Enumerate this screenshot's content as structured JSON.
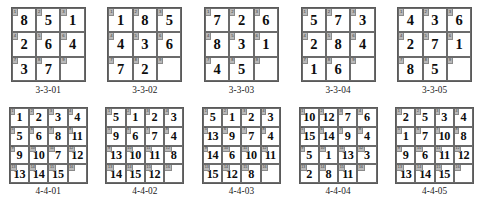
{
  "page": {
    "background_color": "#ffffff",
    "grid_border_color": "#5a5a5a",
    "cell_border_color": "#6b6b6b",
    "index_tag_color": "#b9b9b9",
    "value_color": "#0d0d0d"
  },
  "rows": [
    {
      "name": "three-by-three-row",
      "size": 3,
      "puzzles": [
        {
          "label": "3-3-01",
          "size": 3,
          "cells": [
            {
              "index": "1",
              "value": "8"
            },
            {
              "index": "2",
              "value": "5"
            },
            {
              "index": "3",
              "value": "1"
            },
            {
              "index": "4",
              "value": "2"
            },
            {
              "index": "5",
              "value": "6"
            },
            {
              "index": "6",
              "value": "4"
            },
            {
              "index": "7",
              "value": "3"
            },
            {
              "index": "8",
              "value": "7"
            },
            {
              "index": "9",
              "value": ""
            }
          ]
        },
        {
          "label": "3-3-02",
          "size": 3,
          "cells": [
            {
              "index": "1",
              "value": "1"
            },
            {
              "index": "2",
              "value": "8"
            },
            {
              "index": "3",
              "value": "5"
            },
            {
              "index": "4",
              "value": "4"
            },
            {
              "index": "5",
              "value": "3"
            },
            {
              "index": "6",
              "value": "6"
            },
            {
              "index": "7",
              "value": "7"
            },
            {
              "index": "8",
              "value": "2"
            },
            {
              "index": "9",
              "value": ""
            }
          ]
        },
        {
          "label": "3-3-03",
          "size": 3,
          "cells": [
            {
              "index": "1",
              "value": "7"
            },
            {
              "index": "2",
              "value": "2"
            },
            {
              "index": "3",
              "value": "6"
            },
            {
              "index": "4",
              "value": "8"
            },
            {
              "index": "5",
              "value": "3"
            },
            {
              "index": "6",
              "value": "1"
            },
            {
              "index": "7",
              "value": "4"
            },
            {
              "index": "8",
              "value": "5"
            },
            {
              "index": "9",
              "value": ""
            }
          ]
        },
        {
          "label": "3-3-04",
          "size": 3,
          "cells": [
            {
              "index": "1",
              "value": "5"
            },
            {
              "index": "2",
              "value": "7"
            },
            {
              "index": "3",
              "value": "3"
            },
            {
              "index": "4",
              "value": "2"
            },
            {
              "index": "5",
              "value": "8"
            },
            {
              "index": "6",
              "value": "4"
            },
            {
              "index": "7",
              "value": "1"
            },
            {
              "index": "8",
              "value": "6"
            },
            {
              "index": "9",
              "value": ""
            }
          ]
        },
        {
          "label": "3-3-05",
          "size": 3,
          "cells": [
            {
              "index": "1",
              "value": "4"
            },
            {
              "index": "2",
              "value": "3"
            },
            {
              "index": "3",
              "value": "6"
            },
            {
              "index": "4",
              "value": "2"
            },
            {
              "index": "5",
              "value": "7"
            },
            {
              "index": "6",
              "value": "1"
            },
            {
              "index": "7",
              "value": "8"
            },
            {
              "index": "8",
              "value": "5"
            },
            {
              "index": "9",
              "value": ""
            }
          ]
        }
      ]
    },
    {
      "name": "four-by-four-row",
      "size": 4,
      "puzzles": [
        {
          "label": "4-4-01",
          "size": 4,
          "cells": [
            {
              "index": "1",
              "value": "1"
            },
            {
              "index": "2",
              "value": "2"
            },
            {
              "index": "3",
              "value": "3"
            },
            {
              "index": "4",
              "value": "4"
            },
            {
              "index": "5",
              "value": "5"
            },
            {
              "index": "6",
              "value": "6"
            },
            {
              "index": "7",
              "value": "8"
            },
            {
              "index": "8",
              "value": "11"
            },
            {
              "index": "9",
              "value": "9"
            },
            {
              "index": "10",
              "value": "10"
            },
            {
              "index": "11",
              "value": "7"
            },
            {
              "index": "12",
              "value": "12"
            },
            {
              "index": "13",
              "value": "13"
            },
            {
              "index": "14",
              "value": "14"
            },
            {
              "index": "15",
              "value": "15"
            },
            {
              "index": "16",
              "value": ""
            }
          ]
        },
        {
          "label": "4-4-02",
          "size": 4,
          "cells": [
            {
              "index": "1",
              "value": "5"
            },
            {
              "index": "2",
              "value": "1"
            },
            {
              "index": "3",
              "value": "2"
            },
            {
              "index": "4",
              "value": "3"
            },
            {
              "index": "5",
              "value": "9"
            },
            {
              "index": "6",
              "value": "6"
            },
            {
              "index": "7",
              "value": "7"
            },
            {
              "index": "8",
              "value": "4"
            },
            {
              "index": "9",
              "value": "13"
            },
            {
              "index": "10",
              "value": "10"
            },
            {
              "index": "11",
              "value": "11"
            },
            {
              "index": "12",
              "value": "8"
            },
            {
              "index": "13",
              "value": "14"
            },
            {
              "index": "14",
              "value": "15"
            },
            {
              "index": "15",
              "value": "12"
            },
            {
              "index": "16",
              "value": ""
            }
          ]
        },
        {
          "label": "4-4-03",
          "size": 4,
          "cells": [
            {
              "index": "1",
              "value": "5"
            },
            {
              "index": "2",
              "value": "1"
            },
            {
              "index": "3",
              "value": "2"
            },
            {
              "index": "4",
              "value": "3"
            },
            {
              "index": "5",
              "value": "13"
            },
            {
              "index": "6",
              "value": "9"
            },
            {
              "index": "7",
              "value": "7"
            },
            {
              "index": "8",
              "value": "4"
            },
            {
              "index": "9",
              "value": "14"
            },
            {
              "index": "10",
              "value": "6"
            },
            {
              "index": "11",
              "value": "10"
            },
            {
              "index": "12",
              "value": "11"
            },
            {
              "index": "13",
              "value": "15"
            },
            {
              "index": "14",
              "value": "12"
            },
            {
              "index": "15",
              "value": "8"
            },
            {
              "index": "16",
              "value": ""
            }
          ]
        },
        {
          "label": "4-4-04",
          "size": 4,
          "cells": [
            {
              "index": "1",
              "value": "10"
            },
            {
              "index": "2",
              "value": "12"
            },
            {
              "index": "3",
              "value": "7"
            },
            {
              "index": "4",
              "value": "6"
            },
            {
              "index": "5",
              "value": "15"
            },
            {
              "index": "6",
              "value": "14"
            },
            {
              "index": "7",
              "value": "9"
            },
            {
              "index": "8",
              "value": "4"
            },
            {
              "index": "9",
              "value": "5"
            },
            {
              "index": "10",
              "value": "1"
            },
            {
              "index": "11",
              "value": "13"
            },
            {
              "index": "12",
              "value": "3"
            },
            {
              "index": "13",
              "value": "2"
            },
            {
              "index": "14",
              "value": "8"
            },
            {
              "index": "15",
              "value": "11"
            },
            {
              "index": "16",
              "value": ""
            }
          ]
        },
        {
          "label": "4-4-05",
          "size": 4,
          "cells": [
            {
              "index": "1",
              "value": "2"
            },
            {
              "index": "2",
              "value": "5"
            },
            {
              "index": "3",
              "value": "3"
            },
            {
              "index": "4",
              "value": "4"
            },
            {
              "index": "5",
              "value": "1"
            },
            {
              "index": "6",
              "value": "7"
            },
            {
              "index": "7",
              "value": "10"
            },
            {
              "index": "8",
              "value": "8"
            },
            {
              "index": "9",
              "value": "9"
            },
            {
              "index": "10",
              "value": "6"
            },
            {
              "index": "11",
              "value": "11"
            },
            {
              "index": "12",
              "value": "12"
            },
            {
              "index": "13",
              "value": "13"
            },
            {
              "index": "14",
              "value": "14"
            },
            {
              "index": "15",
              "value": "15"
            },
            {
              "index": "16",
              "value": ""
            }
          ]
        }
      ]
    }
  ]
}
